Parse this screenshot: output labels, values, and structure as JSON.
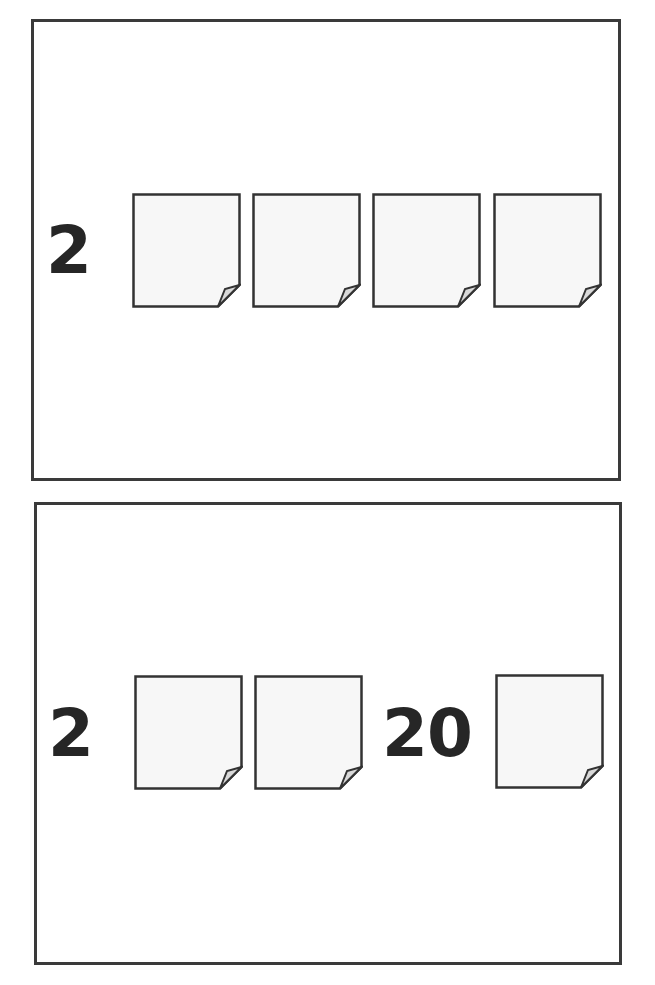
{
  "worksheet": {
    "panels": [
      {
        "row": [
          {
            "type": "numeral",
            "value": "2"
          },
          {
            "type": "card",
            "value": ""
          },
          {
            "type": "card",
            "value": ""
          },
          {
            "type": "card",
            "value": ""
          },
          {
            "type": "card",
            "value": ""
          }
        ]
      },
      {
        "row": [
          {
            "type": "numeral",
            "value": "2"
          },
          {
            "type": "card",
            "value": ""
          },
          {
            "type": "card",
            "value": ""
          },
          {
            "type": "numeral",
            "value": "20"
          },
          {
            "type": "card",
            "value": ""
          }
        ]
      }
    ],
    "colors": {
      "border": "#3a3a3a",
      "ink": "#262626",
      "card_fill": "#f7f7f7",
      "fold_fill": "#d9d9d9"
    }
  }
}
